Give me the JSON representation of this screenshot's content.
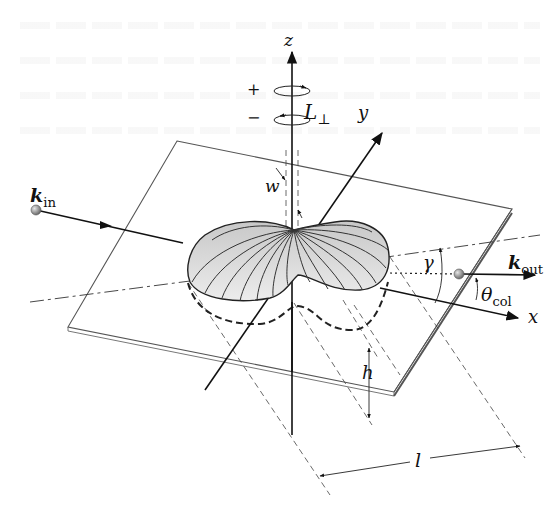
{
  "figure": {
    "axes": {
      "z": "z",
      "y": "y",
      "x": "x"
    },
    "rotation": {
      "plus": "+",
      "minus": "−",
      "angular_momentum": "L",
      "angular_momentum_sub": "⊥"
    },
    "vectors": {
      "incoming": "k",
      "incoming_sub": "in",
      "outgoing": "k",
      "outgoing_sub": "out"
    },
    "angles": {
      "gamma": "γ",
      "theta": "θ",
      "theta_sub": "col"
    },
    "dimensions": {
      "width": "w",
      "height": "h",
      "length": "l"
    },
    "colors": {
      "line": "#1a1a1a",
      "plane_edge": "#555555",
      "lobe_fill": "#d8d8d8",
      "lobe_rib": "#333333",
      "ball": "#8a8a8a"
    }
  }
}
